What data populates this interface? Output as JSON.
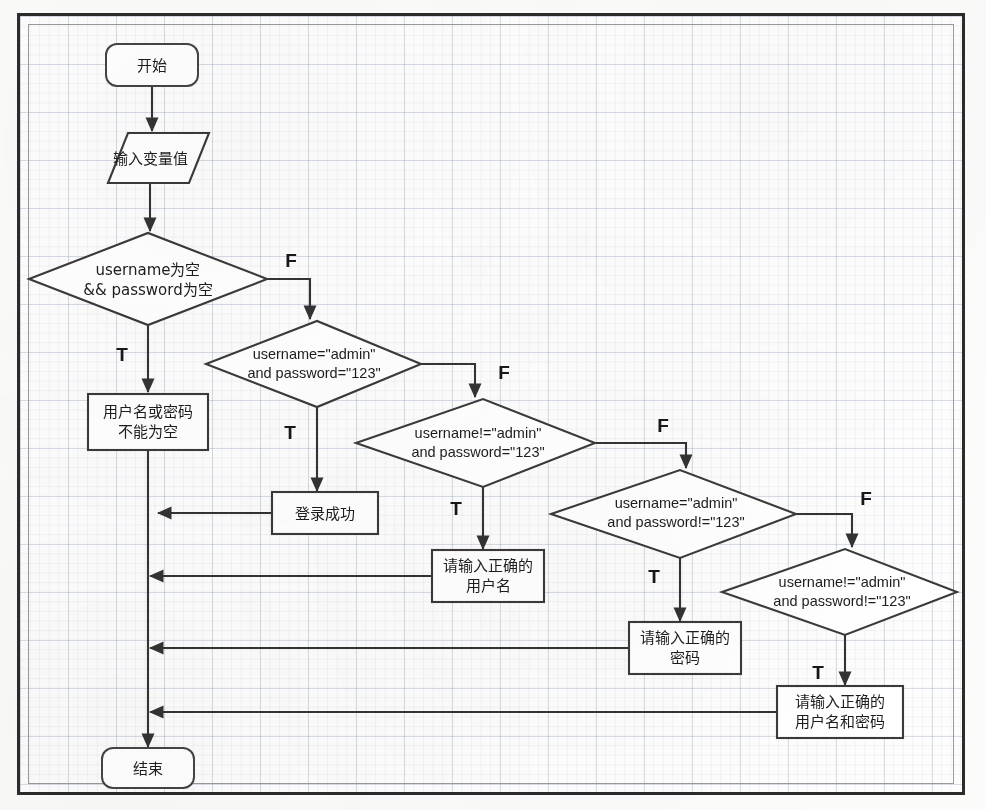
{
  "diagram": {
    "type": "flowchart",
    "colors": {
      "stroke": "#3a3a3a",
      "fill": "#ffffff",
      "frame": "#2b2b2b",
      "grid": "#a9b8cc"
    },
    "nodes": [
      {
        "id": "start",
        "shape": "terminator",
        "lines": [
          "开始"
        ],
        "x": 152,
        "y": 65,
        "w": 92,
        "h": 42
      },
      {
        "id": "input",
        "shape": "parallelogram",
        "lines": [
          "输入变量值"
        ],
        "x": 150,
        "y": 158,
        "w": 118,
        "h": 50
      },
      {
        "id": "d1",
        "shape": "decision",
        "lines": [
          "username为空",
          "&& password为空"
        ],
        "x": 148,
        "y": 279,
        "w": 238,
        "h": 92
      },
      {
        "id": "d2",
        "shape": "decision",
        "lines": [
          "username=\"admin\"",
          "and password=\"123\""
        ],
        "x": 310,
        "y": 364,
        "w": 222,
        "h": 86
      },
      {
        "id": "d3",
        "shape": "decision",
        "lines": [
          "username!=\"admin\"",
          "and password=\"123\""
        ],
        "x": 475,
        "y": 443,
        "w": 240,
        "h": 88
      },
      {
        "id": "d4",
        "shape": "decision",
        "lines": [
          "username=\"admin\"",
          "and  password!=\"123\""
        ],
        "x": 672,
        "y": 514,
        "w": 248,
        "h": 88
      },
      {
        "id": "d5",
        "shape": "decision",
        "lines": [
          "username!=\"admin\"",
          "and password!=\"123\""
        ],
        "x": 840,
        "y": 592,
        "w": 242,
        "h": 86
      },
      {
        "id": "p1",
        "shape": "process",
        "lines": [
          "用户名或密码",
          "不能为空"
        ],
        "x": 148,
        "y": 422,
        "w": 120,
        "h": 56
      },
      {
        "id": "p2",
        "shape": "process",
        "lines": [
          "登录成功"
        ],
        "x": 325,
        "y": 513,
        "w": 106,
        "h": 42
      },
      {
        "id": "p3",
        "shape": "process",
        "lines": [
          "请输入正确的",
          "用户名"
        ],
        "x": 488,
        "y": 576,
        "w": 112,
        "h": 52
      },
      {
        "id": "p4",
        "shape": "process",
        "lines": [
          "请输入正确的",
          "密码"
        ],
        "x": 685,
        "y": 648,
        "w": 112,
        "h": 52
      },
      {
        "id": "p5",
        "shape": "process",
        "lines": [
          "请输入正确的",
          "用户名和密码"
        ],
        "x": 840,
        "y": 712,
        "w": 126,
        "h": 52
      },
      {
        "id": "end",
        "shape": "terminator",
        "lines": [
          "结束"
        ],
        "x": 148,
        "y": 768,
        "w": 92,
        "h": 40
      }
    ],
    "branch_labels": [
      {
        "id": "d1-false",
        "text": "F",
        "x": 291,
        "y": 262
      },
      {
        "id": "d1-true",
        "text": "T",
        "x": 122,
        "y": 356
      },
      {
        "id": "d2-false",
        "text": "F",
        "x": 504,
        "y": 374
      },
      {
        "id": "d2-true",
        "text": "T",
        "x": 290,
        "y": 434
      },
      {
        "id": "d3-false",
        "text": "F",
        "x": 663,
        "y": 427
      },
      {
        "id": "d3-true",
        "text": "T",
        "x": 456,
        "y": 510
      },
      {
        "id": "d4-false",
        "text": "F",
        "x": 866,
        "y": 500
      },
      {
        "id": "d4-true",
        "text": "T",
        "x": 654,
        "y": 578
      },
      {
        "id": "d5-true",
        "text": "T",
        "x": 818,
        "y": 674
      }
    ],
    "edges": [
      {
        "id": "start-input",
        "from": "start",
        "to": "input",
        "label": ""
      },
      {
        "id": "input-d1",
        "from": "input",
        "to": "d1",
        "label": ""
      },
      {
        "id": "d1-p1",
        "from": "d1",
        "to": "p1",
        "label": "T"
      },
      {
        "id": "d1-d2",
        "from": "d1",
        "to": "d2",
        "label": "F"
      },
      {
        "id": "d2-p2",
        "from": "d2",
        "to": "p2",
        "label": "T"
      },
      {
        "id": "d2-d3",
        "from": "d2",
        "to": "d3",
        "label": "F"
      },
      {
        "id": "d3-p3",
        "from": "d3",
        "to": "p3",
        "label": "T"
      },
      {
        "id": "d3-d4",
        "from": "d3",
        "to": "d4",
        "label": "F"
      },
      {
        "id": "d4-p4",
        "from": "d4",
        "to": "p4",
        "label": "T"
      },
      {
        "id": "d4-d5",
        "from": "d4",
        "to": "d5",
        "label": "F"
      },
      {
        "id": "d5-p5",
        "from": "d5",
        "to": "p5",
        "label": "T"
      },
      {
        "id": "p1-end",
        "from": "p1",
        "to": "end",
        "label": ""
      },
      {
        "id": "p2-trunk",
        "from": "p2",
        "to": "end",
        "label": ""
      },
      {
        "id": "p3-trunk",
        "from": "p3",
        "to": "end",
        "label": ""
      },
      {
        "id": "p4-trunk",
        "from": "p4",
        "to": "end",
        "label": ""
      },
      {
        "id": "p5-trunk",
        "from": "p5",
        "to": "end",
        "label": ""
      }
    ]
  }
}
